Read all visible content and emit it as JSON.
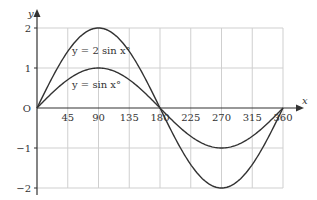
{
  "chart_data": {
    "type": "line",
    "title": "",
    "xlabel": "x",
    "ylabel": "y",
    "xlim": [
      0,
      360
    ],
    "ylim": [
      -2,
      2
    ],
    "grid": true,
    "x_ticks": [
      45,
      90,
      135,
      180,
      225,
      270,
      315,
      360
    ],
    "x_tick_labels": [
      "45",
      "90",
      "135",
      "180",
      "225",
      "270",
      "315",
      "360"
    ],
    "y_ticks": [
      2,
      1,
      0,
      -1,
      -2
    ],
    "y_tick_labels": [
      "2",
      "1",
      "O",
      "−1",
      "−2"
    ],
    "x": [
      0,
      45,
      90,
      135,
      180,
      225,
      270,
      315,
      360
    ],
    "series": [
      {
        "name": "y = 2 sin x°",
        "values": [
          0,
          1.41,
          2,
          1.41,
          0,
          -1.41,
          -2,
          -1.41,
          0
        ]
      },
      {
        "name": "y = sin x°",
        "values": [
          0,
          0.71,
          1,
          0.71,
          0,
          -0.71,
          -1,
          -0.71,
          0
        ]
      }
    ],
    "annotations": [
      {
        "text": "y = 2 sin x°",
        "near": [
          90,
          1.4
        ]
      },
      {
        "text": "y = sin x°",
        "near": [
          90,
          0.6
        ]
      }
    ]
  },
  "labels": {
    "y_axis": "y",
    "x_axis": "x",
    "origin": "O",
    "curve_2sin": "y = 2 sin x°",
    "curve_sin": "y = sin x°"
  },
  "colors": {
    "curve": "#333333",
    "axis": "#333333",
    "grid": "#cfcfcf"
  }
}
